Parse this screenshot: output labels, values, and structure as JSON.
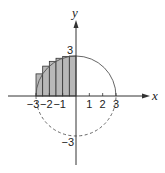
{
  "diagram": {
    "type": "riemann-sum-semicircle",
    "axes": {
      "x_label": "x",
      "y_label": "y",
      "x_ticks": [
        {
          "value": -3,
          "label": "−3"
        },
        {
          "value": -2,
          "label": "−2"
        },
        {
          "value": -1,
          "label": "−1"
        },
        {
          "value": 1,
          "label": "1"
        },
        {
          "value": 2,
          "label": "2"
        },
        {
          "value": 3,
          "label": "3"
        }
      ],
      "y_ticks": [
        {
          "value": 3,
          "label": "3"
        },
        {
          "value": -3,
          "label": "−3"
        }
      ]
    },
    "circle": {
      "center": [
        0,
        0
      ],
      "radius": 3,
      "upper_half": "solid",
      "lower_half": "dashed"
    },
    "rectangles": {
      "count": 6,
      "width": 0.5,
      "interval": [
        -3,
        0
      ],
      "endpoint_rule": "right",
      "fill_color": "#b8b8b8",
      "items": [
        {
          "x0": -3.0,
          "x1": -2.5,
          "height": 1.66
        },
        {
          "x0": -2.5,
          "x1": -2.0,
          "height": 2.24
        },
        {
          "x0": -2.0,
          "x1": -1.5,
          "height": 2.6
        },
        {
          "x0": -1.5,
          "x1": -1.0,
          "height": 2.83
        },
        {
          "x0": -1.0,
          "x1": -0.5,
          "height": 2.96
        },
        {
          "x0": -0.5,
          "x1": 0.0,
          "height": 3.0
        }
      ]
    },
    "colors": {
      "axis": "#333333",
      "curve": "#555555",
      "rect_fill": "#b8b8b8",
      "rect_stroke": "#333333"
    }
  }
}
